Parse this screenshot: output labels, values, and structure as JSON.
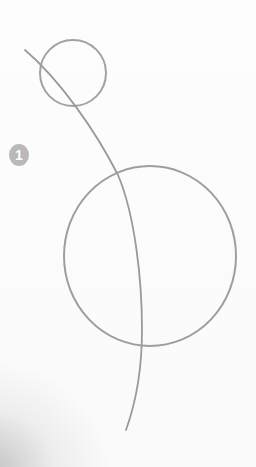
{
  "image": {
    "description": "Pencil sketch on white paper: small circle, large circle and a long curved line passing through both",
    "step_badge": {
      "label": "1",
      "color": "#b9b9b9",
      "text_color": "#ffffff"
    },
    "colors": {
      "pencil": "#9a9a9a",
      "paper": "#ffffff",
      "shadow": "#a0a0a0"
    }
  }
}
